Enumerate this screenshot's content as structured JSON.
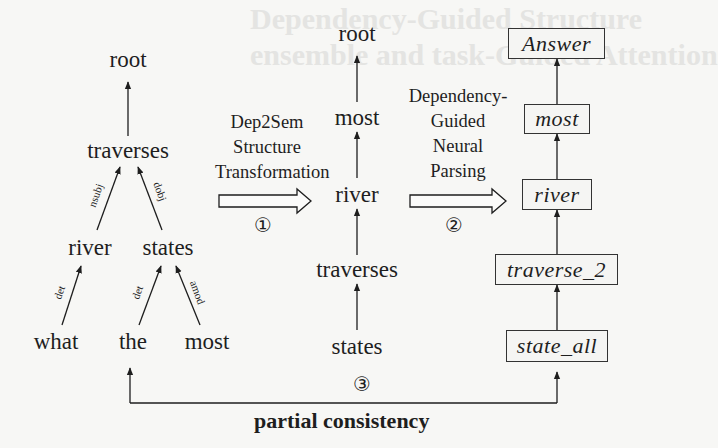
{
  "background_ghost_text": [
    "Dependency-Guided Structure",
    "ensemble and task-Guided Attention"
  ],
  "dependency_tree": {
    "root": "root",
    "head": "traverses",
    "level2": [
      "river",
      "states"
    ],
    "leaves": [
      "what",
      "the",
      "most"
    ],
    "edges": [
      {
        "from": "traverses",
        "to": "root",
        "label": ""
      },
      {
        "from": "river",
        "to": "traverses",
        "label": "nsubj"
      },
      {
        "from": "states",
        "to": "traverses",
        "label": "dobj"
      },
      {
        "from": "what",
        "to": "river",
        "label": "det"
      },
      {
        "from": "the",
        "to": "states",
        "label": "det"
      },
      {
        "from": "most",
        "to": "states",
        "label": "amod"
      }
    ]
  },
  "step1": {
    "label_lines": [
      "Dep2Sem",
      "Structure",
      "Transformation"
    ],
    "number": "①"
  },
  "transformed_structure": {
    "nodes": [
      "root",
      "most",
      "river",
      "traverses",
      "states"
    ]
  },
  "step2": {
    "label_lines": [
      "Dependency-",
      "Guided",
      "Neural",
      "Parsing"
    ],
    "number": "②"
  },
  "semantic_parse": {
    "nodes": [
      "Answer",
      "most",
      "river",
      "traverse_2",
      "state_all"
    ]
  },
  "step3": {
    "number": "③",
    "caption": "partial consistency"
  }
}
